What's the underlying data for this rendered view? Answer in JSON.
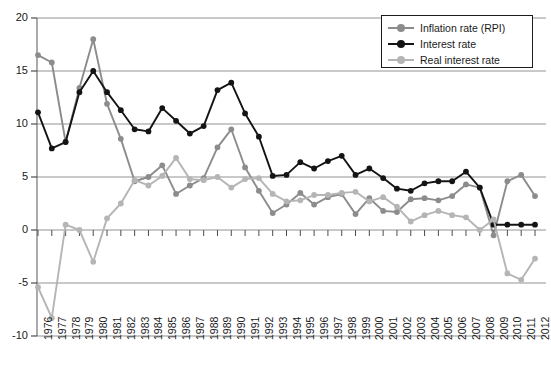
{
  "chart_data": {
    "type": "line",
    "title": "",
    "subtitle": "",
    "xlabel": "",
    "ylabel": "",
    "xlim": [
      1976,
      2012
    ],
    "ylim": [
      -10,
      20
    ],
    "yticks": [
      20,
      15,
      10,
      5,
      0,
      -5,
      -10
    ],
    "grid": true,
    "legend_position": "top-right",
    "categories": [
      "1976",
      "1977",
      "1978",
      "1979",
      "1980",
      "1981",
      "1982",
      "1983",
      "1984",
      "1985",
      "1986",
      "1987",
      "1988",
      "1989",
      "1990",
      "1991",
      "1992",
      "1993",
      "1994",
      "1995",
      "1996",
      "1997",
      "1998",
      "1999",
      "2000",
      "2001",
      "2002",
      "2003",
      "2004",
      "2005",
      "2006",
      "2007",
      "2008",
      "2009",
      "2010",
      "2011",
      "2012"
    ],
    "series": [
      {
        "name": "Inflation rate (RPI)",
        "color": "#8c8c8c",
        "values": [
          16.5,
          15.8,
          8.3,
          13.4,
          18.0,
          11.9,
          8.6,
          4.6,
          5.0,
          6.1,
          3.4,
          4.2,
          4.9,
          7.8,
          9.5,
          5.9,
          3.7,
          1.6,
          2.4,
          3.5,
          2.4,
          3.1,
          3.4,
          1.5,
          3.0,
          1.8,
          1.7,
          2.9,
          3.0,
          2.8,
          3.2,
          4.3,
          4.0,
          -0.5,
          4.6,
          5.2,
          3.2
        ]
      },
      {
        "name": "Interest rate",
        "color": "#141414",
        "values": [
          11.1,
          7.7,
          8.3,
          13.0,
          15.0,
          13.0,
          11.3,
          9.5,
          9.3,
          11.5,
          10.3,
          9.1,
          9.8,
          13.2,
          13.9,
          11.0,
          8.8,
          5.1,
          5.2,
          6.4,
          5.8,
          6.5,
          7.0,
          5.2,
          5.8,
          4.9,
          3.9,
          3.7,
          4.4,
          4.6,
          4.6,
          5.5,
          4.0,
          0.5,
          0.5,
          0.5,
          0.5
        ]
      },
      {
        "name": "Real interest rate",
        "color": "#b5b5b5",
        "values": [
          -5.4,
          -8.3,
          0.5,
          0.0,
          -3.0,
          1.1,
          2.5,
          4.7,
          4.2,
          5.1,
          6.8,
          4.8,
          4.7,
          5.0,
          4.0,
          4.8,
          4.9,
          3.4,
          2.7,
          2.8,
          3.3,
          3.3,
          3.5,
          3.6,
          2.7,
          3.1,
          2.2,
          0.8,
          1.4,
          1.8,
          1.4,
          1.2,
          0.0,
          1.0,
          -4.1,
          -4.7,
          -2.7
        ]
      }
    ]
  },
  "legend": {
    "entries": [
      {
        "label": "Inflation rate (RPI)"
      },
      {
        "label": "Interest rate"
      },
      {
        "label": "Real interest rate"
      }
    ]
  }
}
